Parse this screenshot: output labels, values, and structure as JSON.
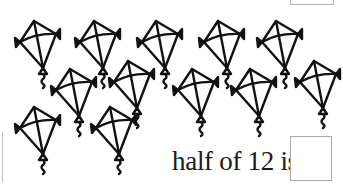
{
  "worksheet": {
    "question": {
      "prompt": "half of 12 is",
      "answer": ""
    },
    "kites": {
      "count": 12,
      "items": [
        {
          "row": 1,
          "x": 12,
          "y": 18
        },
        {
          "row": 1,
          "x": 72,
          "y": 18
        },
        {
          "row": 1,
          "x": 134,
          "y": 18
        },
        {
          "row": 1,
          "x": 196,
          "y": 18
        },
        {
          "row": 1,
          "x": 254,
          "y": 18
        },
        {
          "row": 2,
          "x": 48,
          "y": 66
        },
        {
          "row": 2,
          "x": 106,
          "y": 58
        },
        {
          "row": 2,
          "x": 170,
          "y": 66
        },
        {
          "row": 2,
          "x": 228,
          "y": 66
        },
        {
          "row": 2,
          "x": 292,
          "y": 58
        },
        {
          "row": 3,
          "x": 12,
          "y": 104
        },
        {
          "row": 3,
          "x": 88,
          "y": 104
        }
      ]
    },
    "colors": {
      "ink": "#111111",
      "box_border": "#a8a8a8",
      "background": "#ffffff"
    }
  }
}
